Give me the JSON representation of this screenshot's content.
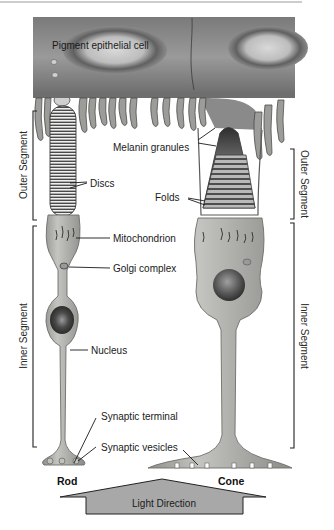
{
  "figure": {
    "labels": {
      "pigment_epithelial_cell": "Pigment epithelial cell",
      "melanin_granules": "Melanin granules",
      "discs": "Discs",
      "folds": "Folds",
      "mitochondrion": "Mitochondrion",
      "golgi_complex": "Golgi complex",
      "nucleus": "Nucleus",
      "synaptic_terminal": "Synaptic terminal",
      "synaptic_vesicles": "Synaptic vesicles"
    },
    "cells": {
      "rod": "Rod",
      "cone": "Cone"
    },
    "brackets": {
      "left_outer": "Outer Segment",
      "left_inner": "Inner Segment",
      "right_outer": "Outer Segment",
      "right_inner": "Inner Segment"
    },
    "arrow": {
      "label": "Light Direction"
    },
    "colors": {
      "epithelium_dark": "#5c5c5c",
      "epithelium_light": "#b5b5b5",
      "cell_body": "#a9a9a6",
      "cell_edge": "#6e6e6a",
      "arrow_fill": "#a8a8a8",
      "text": "#1a1a1a"
    }
  }
}
